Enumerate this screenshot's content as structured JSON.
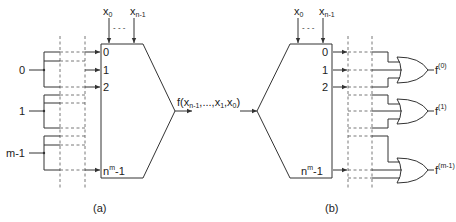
{
  "panel_a": {
    "caption": "(a)",
    "input_top_first": "x",
    "input_top_first_sub": "0",
    "input_top_last": "x",
    "input_top_last_sub": "n-1",
    "ellipsis": "- - -",
    "data_inputs": [
      "0",
      "1",
      "2"
    ],
    "last_input_base": "n",
    "last_input_sup": "m",
    "last_input_suffix": "-1",
    "sources": [
      "0",
      "1",
      "m-1"
    ],
    "output_label": "f(x",
    "output_sub1": "n-1",
    "output_mid": ",...,x",
    "output_sub2": "1",
    "output_mid2": ",x",
    "output_sub3": "0",
    "output_end": ")"
  },
  "panel_b": {
    "caption": "(b)",
    "input_top_first": "x",
    "input_top_first_sub": "0",
    "input_top_last": "x",
    "input_top_last_sub": "n-1",
    "ellipsis": "- - -",
    "data_outputs": [
      "0",
      "1",
      "2"
    ],
    "last_output_base": "n",
    "last_output_sup": "m",
    "last_output_suffix": "-1",
    "or_outputs": [
      {
        "base": "f",
        "sup": "(0)"
      },
      {
        "base": "f",
        "sup": "(1)"
      },
      {
        "base": "f",
        "sup": "(m-1)"
      }
    ]
  }
}
